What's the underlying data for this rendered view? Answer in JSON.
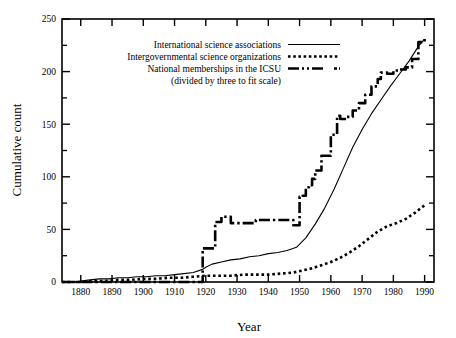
{
  "chart_data": {
    "type": "line",
    "title": "",
    "xlabel": "Year",
    "ylabel": "Cumulative count",
    "xlim": [
      1874,
      1993
    ],
    "ylim": [
      0,
      250
    ],
    "grid": false,
    "legend_position": "upper-left-inside",
    "xticks": [
      1880,
      1890,
      1900,
      1910,
      1920,
      1930,
      1940,
      1950,
      1960,
      1970,
      1980,
      1990
    ],
    "xtick_labels": [
      "1880",
      "1890",
      "1900",
      "1910",
      "1920",
      "1930",
      "1940",
      "1950",
      "1960",
      "1970",
      "1980",
      "1990"
    ],
    "yticks": [
      0,
      50,
      100,
      150,
      200,
      250
    ],
    "ytick_labels": [
      "0",
      "50",
      "100",
      "150",
      "200",
      "250"
    ],
    "yminor_ticks": [
      25,
      75,
      125,
      175,
      225
    ],
    "series": [
      {
        "name": "International science associations",
        "style": "solid",
        "x": [
          1874,
          1878,
          1880,
          1883,
          1886,
          1889,
          1892,
          1895,
          1898,
          1901,
          1904,
          1907,
          1910,
          1913,
          1916,
          1919,
          1920,
          1922,
          1925,
          1928,
          1931,
          1934,
          1937,
          1940,
          1943,
          1946,
          1949,
          1952,
          1955,
          1958,
          1961,
          1964,
          1967,
          1970,
          1973,
          1976,
          1979,
          1982,
          1985,
          1988,
          1990
        ],
        "values": [
          0,
          0,
          1,
          2,
          3,
          3,
          4,
          4,
          5,
          5,
          6,
          6,
          7,
          8,
          9,
          12,
          14,
          17,
          19,
          21,
          22,
          24,
          25,
          27,
          28,
          30,
          33,
          42,
          55,
          70,
          88,
          108,
          128,
          145,
          160,
          173,
          186,
          198,
          210,
          224,
          231
        ]
      },
      {
        "name": "Intergovernmental science organizations",
        "style": "dotted",
        "x": [
          1874,
          1878,
          1880,
          1884,
          1888,
          1892,
          1896,
          1900,
          1904,
          1908,
          1912,
          1916,
          1920,
          1924,
          1928,
          1932,
          1936,
          1940,
          1944,
          1948,
          1951,
          1954,
          1957,
          1960,
          1963,
          1966,
          1969,
          1972,
          1975,
          1978,
          1981,
          1984,
          1987,
          1990
        ],
        "values": [
          0,
          0,
          0,
          1,
          1,
          2,
          2,
          3,
          3,
          4,
          4,
          5,
          6,
          6,
          6,
          7,
          7,
          7,
          8,
          9,
          11,
          13,
          16,
          19,
          23,
          28,
          34,
          41,
          48,
          53,
          56,
          60,
          66,
          73
        ]
      },
      {
        "name": "National memberships in the ICSU (divided by three to fit scale)",
        "style": "dash-dot",
        "note": "step curve; values are plotted count divided by three",
        "x": [
          1874,
          1918,
          1919,
          1922,
          1923,
          1925,
          1927,
          1928,
          1931,
          1934,
          1936,
          1939,
          1941,
          1944,
          1946,
          1948,
          1949,
          1950,
          1951,
          1952,
          1953,
          1954,
          1955,
          1957,
          1960,
          1962,
          1963,
          1965,
          1967,
          1969,
          1971,
          1973,
          1975,
          1976,
          1978,
          1980,
          1982,
          1984,
          1986,
          1988,
          1990
        ],
        "values": [
          0,
          0,
          32,
          32,
          57,
          62,
          62,
          56,
          56,
          56,
          59,
          59,
          59,
          59,
          59,
          54,
          54,
          81,
          82,
          90,
          92,
          98,
          106,
          120,
          140,
          158,
          155,
          157,
          163,
          170,
          178,
          186,
          193,
          199,
          198,
          201,
          202,
          204,
          212,
          228,
          232
        ]
      }
    ]
  },
  "legend": {
    "entries": [
      {
        "label": "International science associations",
        "style": "solid"
      },
      {
        "label": "Intergovernmental science organizations",
        "style": "dotted"
      },
      {
        "label": "National memberships in the ICSU",
        "style": "dash-dot"
      }
    ],
    "sublabel": "(divided by three to fit scale)"
  },
  "axes": {
    "x_title": "Year",
    "y_title": "Cumulative count"
  }
}
